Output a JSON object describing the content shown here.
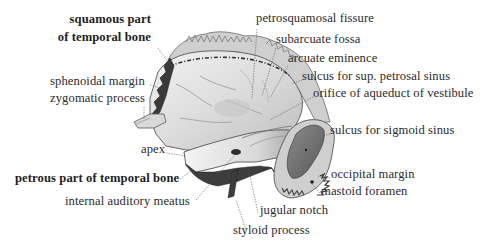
{
  "figure": {
    "colors": {
      "background": "#ffffff",
      "label_text": "#2b2b2b",
      "leader_line": "#555555",
      "bone_light": "#e6e6e6",
      "bone_mid": "#a8a8a8",
      "bone_dark": "#4a4a4a"
    },
    "labels": {
      "squamous_part_line1": "squamous part",
      "squamous_part_line2": "of temporal bone",
      "sphenoidal_margin": "sphenoidal margin",
      "zygomatic_process": "zygomatic process",
      "petrosquamosal_fissure": "petrosquamosal fissure",
      "subarcuate_fossa": "subarcuate fossa",
      "arcuate_eminence": "arcuate eminence",
      "sulcus_sup_petrosal_sinus": "sulcus for sup. petrosal sinus",
      "orifice_aqueduct_vestibule": "orifice of aqueduct of vestibule",
      "sulcus_sigmoid_sinus": "sulcus for sigmoid sinus",
      "apex": "apex",
      "petrous_part": "petrous part of temporal bone",
      "internal_auditory_meatus": "internal auditory meatus",
      "occipital_margin": "occipital margin",
      "mastoid_foramen": "mastoid foramen",
      "jugular_notch": "jugular notch",
      "styloid_process": "styloid process"
    }
  }
}
